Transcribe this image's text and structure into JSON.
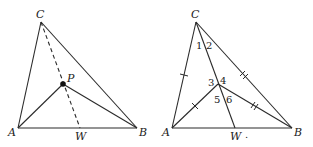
{
  "figures": [
    {
      "id": "left",
      "vertices": {
        "C": {
          "label": "C",
          "x": 41,
          "y": 22
        },
        "A": {
          "label": "A",
          "x": 18,
          "y": 128
        },
        "B": {
          "label": "B",
          "x": 137,
          "y": 128
        }
      },
      "point_P": {
        "label": "P",
        "x": 63,
        "y": 84
      },
      "foot_W": {
        "label": "W",
        "x": 80,
        "y": 128
      },
      "segments": [
        "CA",
        "CB",
        "AB",
        "PA",
        "PB"
      ],
      "dashed": [
        "CW"
      ]
    },
    {
      "id": "right",
      "vertices": {
        "C": {
          "label": "C",
          "x": 196,
          "y": 22
        },
        "A": {
          "label": "A",
          "x": 172,
          "y": 128
        },
        "B": {
          "label": "B",
          "x": 292,
          "y": 128
        }
      },
      "point_P": {
        "x": 218,
        "y": 84
      },
      "foot_W": {
        "label": "W",
        "x": 235,
        "y": 128
      },
      "angle_labels": [
        "1",
        "2",
        "3",
        "4",
        "5",
        "6"
      ],
      "segments": [
        "CA",
        "CB",
        "AB",
        "PA",
        "PB",
        "CW"
      ],
      "tick_marks": {
        "single": [
          "CA",
          "PA"
        ],
        "double": [
          "CB",
          "PB"
        ]
      }
    }
  ],
  "labels": {
    "left_C": "C",
    "left_A": "A",
    "left_B": "B",
    "left_P": "P",
    "left_W": "W",
    "right_C": "C",
    "right_A": "A",
    "right_B": "B",
    "right_W": "W",
    "angle_1": "1",
    "angle_2": "2",
    "angle_3": "3",
    "angle_4": "4",
    "angle_5": "5",
    "angle_6": "6",
    "w_dot": "."
  }
}
